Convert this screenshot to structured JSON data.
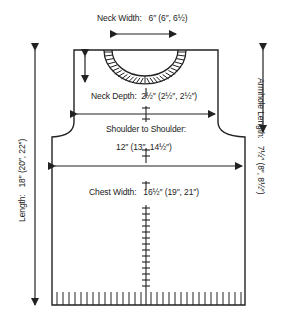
{
  "diagram": {
    "type": "knitting-schematic",
    "piece": "sweater-front",
    "colors": {
      "line": "#222222",
      "background": "#ffffff"
    },
    "measurements": {
      "neck_width": {
        "label": "Neck Width:",
        "value": "6″ (6″, 6½)"
      },
      "neck_depth": {
        "label": "Neck Depth:",
        "value": "2½″ (2½″, 2½″)"
      },
      "shoulder": {
        "label": "Shoulder to Shoulder:",
        "value": "12″ (13″, 14½″)"
      },
      "chest_width": {
        "label": "Chest Width:",
        "value": "16½″ (19″, 21″)"
      },
      "length": {
        "label": "Length:",
        "value": "18″ (20″, 22″)"
      },
      "armhole_length": {
        "label": "Armhole Length:",
        "value": "7½″ (8″, 8½″)"
      }
    }
  }
}
